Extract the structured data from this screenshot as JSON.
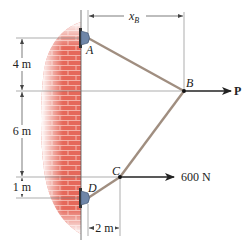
{
  "figure": {
    "type": "statics-cable-diagram",
    "colors": {
      "wall_brick": "#e5685a",
      "wall_mortar": "#f4b2a8",
      "cable": "#a08e80",
      "support": "#6f86a8",
      "line": "#555555",
      "arrow": "#222222"
    },
    "points": {
      "A": {
        "label": "A"
      },
      "B": {
        "label": "B"
      },
      "C": {
        "label": "C"
      },
      "D": {
        "label": "D"
      }
    },
    "forces": {
      "P": {
        "label": "P",
        "at": "B",
        "direction": "right"
      },
      "F_C": {
        "label": "600 N",
        "at": "C",
        "direction": "right"
      }
    },
    "dimensions": {
      "xB": {
        "label": "x",
        "subscript": "B"
      },
      "AB_vertical": {
        "label": "4 m"
      },
      "BC_vertical": {
        "label": "6 m"
      },
      "CD_vertical": {
        "label": "1 m"
      },
      "DC_horizontal": {
        "label": "2 m"
      }
    }
  }
}
